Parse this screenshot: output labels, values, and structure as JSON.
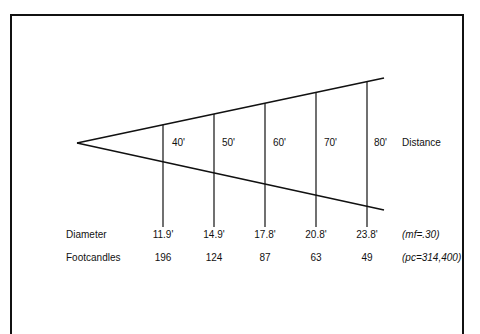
{
  "diagram": {
    "type": "beam-spread",
    "row_label_distance": "Distance",
    "row_label_diameter": "Diameter",
    "row_label_footcandles": "Footcandles",
    "diameter_note": "(mf=.30)",
    "footcandles_note": "(pc=314,400)",
    "stations": [
      {
        "distance": "40'",
        "diameter": "11.9'",
        "footcandles": "196"
      },
      {
        "distance": "50'",
        "diameter": "14.9'",
        "footcandles": "124"
      },
      {
        "distance": "60'",
        "diameter": "17.8'",
        "footcandles": "87"
      },
      {
        "distance": "70'",
        "diameter": "20.8'",
        "footcandles": "63"
      },
      {
        "distance": "80'",
        "diameter": "23.8'",
        "footcandles": "49"
      }
    ],
    "line_color": "#111111"
  }
}
